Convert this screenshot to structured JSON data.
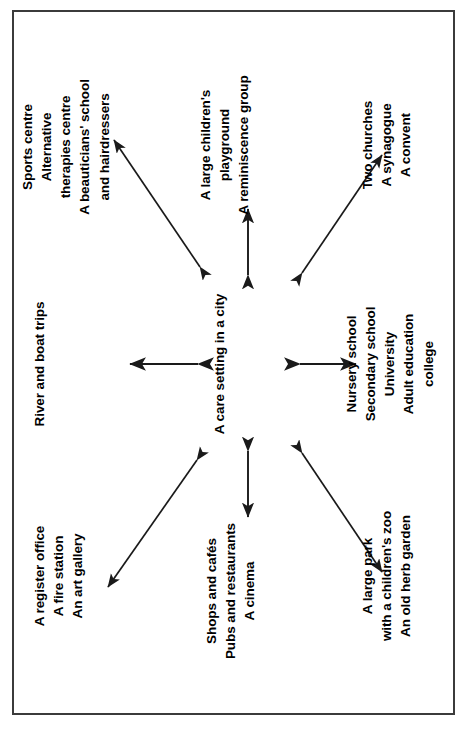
{
  "diagram": {
    "title_node": "A care setting in a city",
    "center": {
      "label": "A care setting in a city"
    },
    "nodes": [
      {
        "id": "civic-amenities",
        "position": "top-left",
        "text": "A register office\nA fire station\nAn art gallery"
      },
      {
        "id": "waterways",
        "position": "top-center",
        "text": "River and boat trips"
      },
      {
        "id": "wellbeing-services",
        "position": "top-right",
        "text": "Sports centre\nAlternative\ntherapies centre\nA beauticians' school\nand hairdressers"
      },
      {
        "id": "shops-and-leisure",
        "position": "middle-left",
        "text": "Shops and cafés\nPubs and restaurants\nA cinema"
      },
      {
        "id": "children-and-memory",
        "position": "middle-right",
        "text": "A large children's\nplayground\nA reminiscence group"
      },
      {
        "id": "parks-and-gardens",
        "position": "bottom-left",
        "text": "A large park\nwith a children's zoo\nAn old herb garden"
      },
      {
        "id": "education",
        "position": "bottom-center",
        "text": "Nursery school\nSecondary school\nUniversity\nAdult education\ncollege"
      },
      {
        "id": "places-of-worship",
        "position": "bottom-right",
        "text": "Two churches\nA synagogue\nA convent"
      }
    ],
    "connectors": [
      {
        "id": "connector-to-civic-amenities",
        "style": "double-headed-arrow",
        "direction": "diagonal-up-left"
      },
      {
        "id": "connector-to-waterways",
        "style": "double-headed-arrow",
        "direction": "up"
      },
      {
        "id": "connector-to-wellbeing-services",
        "style": "double-headed-arrow",
        "direction": "diagonal-up-right"
      },
      {
        "id": "connector-to-shops-and-leisure",
        "style": "double-headed-arrow",
        "direction": "left"
      },
      {
        "id": "connector-to-children-and-memory",
        "style": "double-headed-arrow",
        "direction": "right"
      },
      {
        "id": "connector-to-parks-and-gardens",
        "style": "double-headed-arrow",
        "direction": "diagonal-down-left"
      },
      {
        "id": "connector-to-education",
        "style": "double-headed-arrow",
        "direction": "down"
      },
      {
        "id": "connector-to-places-of-worship",
        "style": "double-headed-arrow",
        "direction": "diagonal-down-right"
      }
    ],
    "colors": {
      "text": "#000000",
      "border": "#3b3b3b",
      "background": "#ffffff",
      "arrow": "#1a1a1a"
    }
  }
}
